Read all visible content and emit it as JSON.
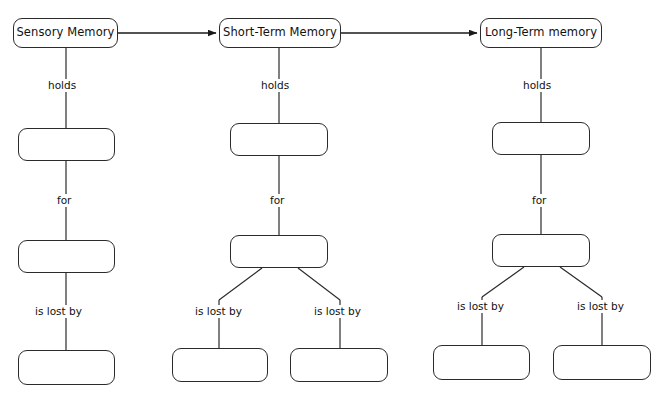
{
  "diagram": {
    "background_color": "#ffffff",
    "stroke_color": "#2b2b2b",
    "text_color": "#111111",
    "columns": [
      {
        "key": "sensory",
        "header": {
          "label": "Sensory Memory",
          "x": 13,
          "y": 18,
          "w": 105,
          "h": 30,
          "filled": true
        },
        "edges": [
          {
            "label": "holds",
            "x": 46,
            "y": 79
          },
          {
            "label": "for",
            "x": 55,
            "y": 194
          },
          {
            "label": "is lost by",
            "x": 33,
            "y": 305
          }
        ],
        "boxes": [
          {
            "label": "",
            "x": 18,
            "y": 128,
            "w": 97,
            "h": 33,
            "filled": false
          },
          {
            "label": "",
            "x": 18,
            "y": 240,
            "w": 97,
            "h": 33,
            "filled": false
          },
          {
            "label": "",
            "x": 18,
            "y": 350,
            "w": 97,
            "h": 35,
            "filled": false
          }
        ]
      },
      {
        "key": "short-term",
        "header": {
          "label": "Short-Term Memory",
          "x": 219,
          "y": 18,
          "w": 122,
          "h": 30,
          "filled": true
        },
        "edges": [
          {
            "label": "holds",
            "x": 259,
            "y": 79
          },
          {
            "label": "for",
            "x": 268,
            "y": 194
          },
          {
            "label": "is lost by",
            "x": 193,
            "y": 305
          },
          {
            "label": "is lost by",
            "x": 312,
            "y": 305
          }
        ],
        "boxes": [
          {
            "label": "",
            "x": 230,
            "y": 123,
            "w": 98,
            "h": 33,
            "filled": false
          },
          {
            "label": "",
            "x": 230,
            "y": 235,
            "w": 98,
            "h": 33,
            "filled": false
          },
          {
            "label": "",
            "x": 172,
            "y": 348,
            "w": 96,
            "h": 34,
            "filled": false
          },
          {
            "label": "",
            "x": 290,
            "y": 348,
            "w": 98,
            "h": 34,
            "filled": false
          }
        ]
      },
      {
        "key": "long-term",
        "header": {
          "label": "Long-Term memory",
          "x": 480,
          "y": 18,
          "w": 122,
          "h": 30,
          "filled": true
        },
        "edges": [
          {
            "label": "holds",
            "x": 521,
            "y": 79
          },
          {
            "label": "for",
            "x": 530,
            "y": 194
          },
          {
            "label": "is lost by",
            "x": 455,
            "y": 300
          },
          {
            "label": "is lost by",
            "x": 575,
            "y": 300
          }
        ],
        "boxes": [
          {
            "label": "",
            "x": 492,
            "y": 122,
            "w": 98,
            "h": 33,
            "filled": false
          },
          {
            "label": "",
            "x": 492,
            "y": 234,
            "w": 98,
            "h": 33,
            "filled": false
          },
          {
            "label": "",
            "x": 433,
            "y": 345,
            "w": 97,
            "h": 35,
            "filled": false
          },
          {
            "label": "",
            "x": 553,
            "y": 345,
            "w": 98,
            "h": 35,
            "filled": false
          }
        ]
      }
    ],
    "flow_arrows": [
      {
        "from": "Sensory Memory",
        "to": "Short-Term Memory",
        "x1": 118,
        "y1": 33,
        "x2": 216,
        "y2": 33
      },
      {
        "from": "Short-Term Memory",
        "to": "Long-Term memory",
        "x1": 341,
        "y1": 33,
        "x2": 477,
        "y2": 33
      }
    ],
    "connectors": [
      {
        "type": "vertical",
        "x1": 66,
        "y1": 48,
        "x2": 66,
        "y2": 128
      },
      {
        "type": "vertical",
        "x1": 66,
        "y1": 161,
        "x2": 66,
        "y2": 240
      },
      {
        "type": "vertical",
        "x1": 66,
        "y1": 273,
        "x2": 66,
        "y2": 350
      },
      {
        "type": "vertical",
        "x1": 279,
        "y1": 48,
        "x2": 279,
        "y2": 123
      },
      {
        "type": "vertical",
        "x1": 279,
        "y1": 156,
        "x2": 279,
        "y2": 235
      },
      {
        "type": "diagonal",
        "x1": 262,
        "y1": 268,
        "x2": 219,
        "y2": 300
      },
      {
        "type": "diagonal",
        "x1": 298,
        "y1": 268,
        "x2": 340,
        "y2": 300
      },
      {
        "type": "vertical",
        "x1": 219,
        "y1": 300,
        "x2": 219,
        "y2": 348
      },
      {
        "type": "vertical",
        "x1": 340,
        "y1": 300,
        "x2": 340,
        "y2": 348
      },
      {
        "type": "vertical",
        "x1": 541,
        "y1": 48,
        "x2": 541,
        "y2": 122
      },
      {
        "type": "vertical",
        "x1": 541,
        "y1": 155,
        "x2": 541,
        "y2": 234
      },
      {
        "type": "diagonal",
        "x1": 524,
        "y1": 267,
        "x2": 482,
        "y2": 297
      },
      {
        "type": "diagonal",
        "x1": 560,
        "y1": 267,
        "x2": 602,
        "y2": 297
      },
      {
        "type": "vertical",
        "x1": 482,
        "y1": 297,
        "x2": 482,
        "y2": 345
      },
      {
        "type": "vertical",
        "x1": 602,
        "y1": 297,
        "x2": 602,
        "y2": 345
      }
    ]
  }
}
